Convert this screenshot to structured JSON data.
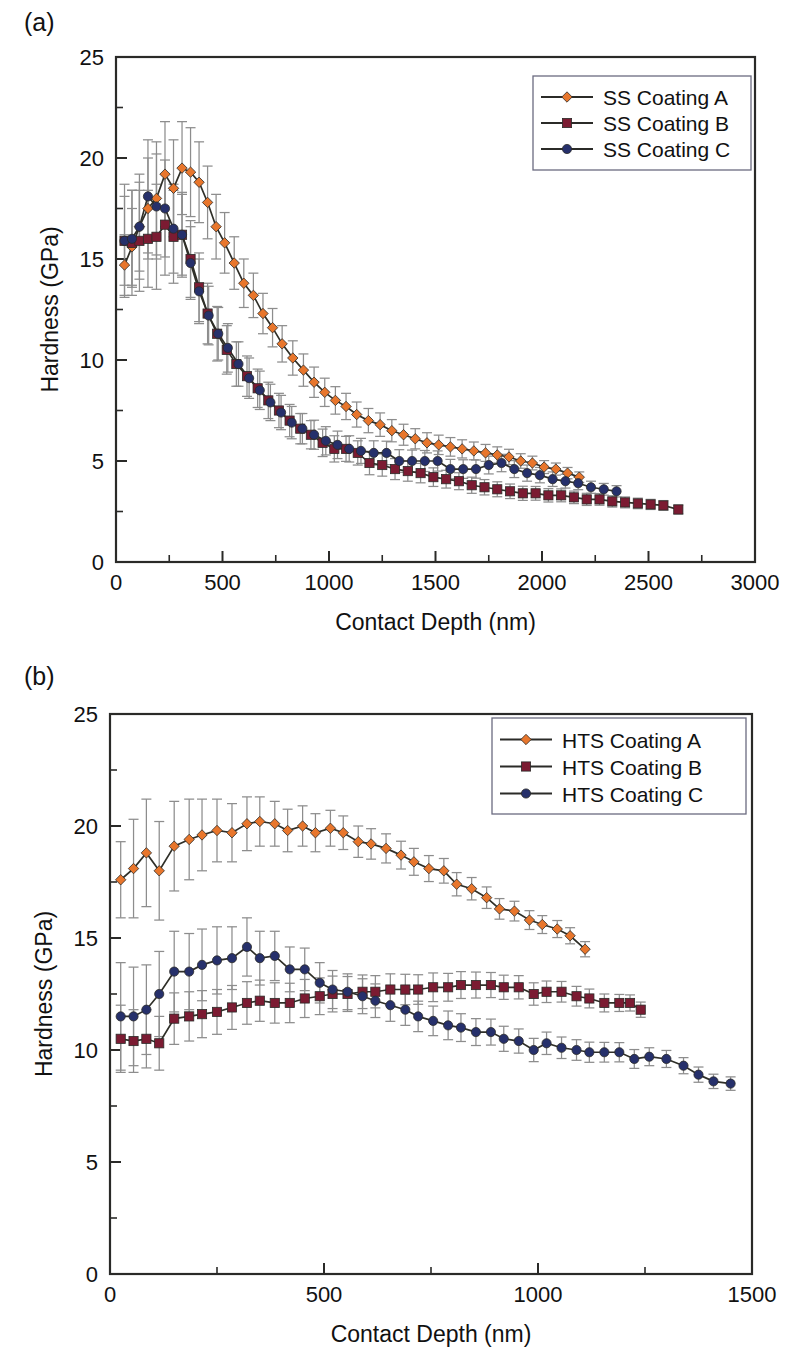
{
  "figure": {
    "panels": [
      {
        "id": "a",
        "label": "(a)",
        "xlabel": "Contact Depth (nm)",
        "ylabel": "Hardness (GPa)",
        "xticks": [
          0,
          500,
          1000,
          1500,
          2000,
          2500,
          3000
        ],
        "yticks": [
          0,
          5,
          10,
          15,
          20,
          25
        ],
        "xlim": [
          0,
          3000
        ],
        "ylim": [
          0,
          25
        ]
      },
      {
        "id": "b",
        "label": "(b)",
        "xlabel": "Contact Depth (nm)",
        "ylabel": "Hardness (GPa)",
        "xticks": [
          0,
          500,
          1000,
          1500
        ],
        "yticks": [
          0,
          5,
          10,
          15,
          20,
          25
        ],
        "xlim": [
          0,
          1500
        ],
        "ylim": [
          0,
          25
        ]
      }
    ]
  },
  "colors": {
    "series_a": "#E8762C",
    "series_b": "#7B1B32",
    "series_c": "#26306B",
    "line": "#2F2F28",
    "errorbar": "#8D8D8D",
    "frame": "#2A2A28",
    "legend_border": "#6B6B80",
    "background": "#FFFFFF"
  },
  "chart_data": [
    {
      "type": "line",
      "panel": "a",
      "title": "",
      "xlabel": "Contact Depth (nm)",
      "ylabel": "Hardness (GPa)",
      "xlim": [
        0,
        3000
      ],
      "ylim": [
        0,
        25
      ],
      "xticks": [
        0,
        500,
        1000,
        1500,
        2000,
        2500,
        3000
      ],
      "yticks": [
        0,
        5,
        10,
        15,
        20,
        25
      ],
      "grid": false,
      "legend_position": "top-right",
      "error_bars": "symmetric-y",
      "series": [
        {
          "name": "SS Coating A",
          "color": "#E8762C",
          "marker": "diamond",
          "x": [
            40,
            75,
            110,
            150,
            190,
            230,
            270,
            310,
            350,
            390,
            430,
            470,
            510,
            555,
            600,
            645,
            690,
            735,
            780,
            830,
            880,
            930,
            980,
            1030,
            1080,
            1130,
            1185,
            1240,
            1295,
            1350,
            1405,
            1460,
            1515,
            1570,
            1625,
            1680,
            1735,
            1790,
            1845,
            1900,
            1955,
            2010,
            2065,
            2120,
            2175
          ],
          "y": [
            14.7,
            15.6,
            16.6,
            17.5,
            18.0,
            19.2,
            18.5,
            19.5,
            19.3,
            18.8,
            17.8,
            16.6,
            15.8,
            14.8,
            13.8,
            13.2,
            12.3,
            11.6,
            10.8,
            10.1,
            9.5,
            8.9,
            8.4,
            8.0,
            7.7,
            7.3,
            7.0,
            6.8,
            6.5,
            6.3,
            6.1,
            5.9,
            5.8,
            5.7,
            5.6,
            5.5,
            5.4,
            5.3,
            5.2,
            5.0,
            4.9,
            4.7,
            4.6,
            4.4,
            4.2
          ],
          "yerr": [
            1.5,
            1.9,
            2.2,
            2.5,
            2.8,
            2.6,
            2.4,
            2.3,
            2.2,
            2.0,
            1.8,
            1.6,
            1.5,
            1.3,
            1.2,
            1.1,
            1.0,
            0.95,
            0.9,
            0.85,
            0.8,
            0.75,
            0.7,
            0.68,
            0.65,
            0.62,
            0.6,
            0.58,
            0.55,
            0.52,
            0.5,
            0.5,
            0.48,
            0.46,
            0.45,
            0.44,
            0.42,
            0.4,
            0.38,
            0.36,
            0.34,
            0.32,
            0.3,
            0.28,
            0.26
          ]
        },
        {
          "name": "SS Coating B",
          "color": "#7B1B32",
          "marker": "square",
          "x": [
            40,
            75,
            110,
            150,
            190,
            230,
            270,
            310,
            350,
            390,
            430,
            475,
            520,
            565,
            615,
            665,
            715,
            765,
            815,
            865,
            915,
            970,
            1025,
            1080,
            1135,
            1190,
            1250,
            1310,
            1370,
            1430,
            1490,
            1550,
            1610,
            1670,
            1730,
            1790,
            1850,
            1910,
            1970,
            2030,
            2090,
            2150,
            2210,
            2270,
            2330,
            2390,
            2450,
            2510,
            2570,
            2640
          ],
          "y": [
            15.9,
            15.8,
            15.9,
            16.0,
            16.1,
            16.7,
            16.1,
            16.2,
            15.0,
            13.6,
            12.3,
            11.3,
            10.5,
            9.8,
            9.2,
            8.6,
            8.0,
            7.5,
            7.0,
            6.6,
            6.3,
            5.9,
            5.6,
            5.6,
            5.4,
            4.9,
            4.8,
            4.6,
            4.5,
            4.4,
            4.2,
            4.1,
            4.0,
            3.8,
            3.7,
            3.6,
            3.5,
            3.4,
            3.4,
            3.3,
            3.3,
            3.2,
            3.1,
            3.1,
            3.0,
            2.95,
            2.9,
            2.85,
            2.8,
            2.6
          ],
          "yerr": [
            2.8,
            2.6,
            2.5,
            2.4,
            2.6,
            2.5,
            2.3,
            2.1,
            1.9,
            1.7,
            1.5,
            1.35,
            1.2,
            1.1,
            1.0,
            0.95,
            0.9,
            0.85,
            0.8,
            0.75,
            0.7,
            0.68,
            0.65,
            0.62,
            0.6,
            0.58,
            0.55,
            0.52,
            0.5,
            0.48,
            0.46,
            0.44,
            0.42,
            0.4,
            0.38,
            0.37,
            0.36,
            0.35,
            0.34,
            0.33,
            0.32,
            0.31,
            0.3,
            0.29,
            0.28,
            0.27,
            0.26,
            0.25,
            0.24,
            0.22
          ]
        },
        {
          "name": "SS Coating C",
          "color": "#26306B",
          "marker": "circle",
          "x": [
            40,
            75,
            110,
            150,
            190,
            230,
            270,
            310,
            350,
            390,
            435,
            480,
            525,
            575,
            625,
            675,
            725,
            775,
            825,
            875,
            930,
            985,
            1040,
            1095,
            1150,
            1210,
            1270,
            1330,
            1390,
            1450,
            1510,
            1570,
            1630,
            1690,
            1750,
            1810,
            1870,
            1930,
            1990,
            2050,
            2110,
            2170,
            2230,
            2290,
            2350
          ],
          "y": [
            15.9,
            16.0,
            16.6,
            18.1,
            17.6,
            17.5,
            16.5,
            16.2,
            14.8,
            13.4,
            12.2,
            11.3,
            10.6,
            9.8,
            9.1,
            8.5,
            7.9,
            7.4,
            6.9,
            6.6,
            6.3,
            6.0,
            5.8,
            5.6,
            5.5,
            5.4,
            5.4,
            5.0,
            5.0,
            5.0,
            5.0,
            4.6,
            4.6,
            4.6,
            4.8,
            4.9,
            4.6,
            4.4,
            4.3,
            4.1,
            4.0,
            3.9,
            3.7,
            3.6,
            3.5
          ],
          "yerr": [
            2.2,
            2.4,
            2.6,
            2.8,
            2.6,
            2.4,
            2.2,
            2.0,
            1.8,
            1.6,
            1.45,
            1.3,
            1.2,
            1.1,
            1.0,
            0.95,
            0.9,
            0.85,
            0.8,
            0.75,
            0.72,
            0.7,
            0.68,
            0.65,
            0.62,
            0.6,
            0.58,
            0.56,
            0.54,
            0.52,
            0.5,
            0.48,
            0.46,
            0.45,
            0.44,
            0.43,
            0.42,
            0.4,
            0.38,
            0.36,
            0.34,
            0.32,
            0.3,
            0.29,
            0.28
          ]
        }
      ]
    },
    {
      "type": "line",
      "panel": "b",
      "title": "",
      "xlabel": "Contact Depth (nm)",
      "ylabel": "Hardness (GPa)",
      "xlim": [
        0,
        1500
      ],
      "ylim": [
        0,
        25
      ],
      "xticks": [
        0,
        500,
        1000,
        1500
      ],
      "yticks": [
        0,
        5,
        10,
        15,
        20,
        25
      ],
      "grid": false,
      "legend_position": "top-right",
      "error_bars": "symmetric-y",
      "series": [
        {
          "name": "HTS Coating A",
          "color": "#E8762C",
          "marker": "diamond",
          "x": [
            25,
            55,
            85,
            115,
            150,
            185,
            215,
            250,
            285,
            320,
            350,
            385,
            415,
            450,
            480,
            515,
            545,
            580,
            610,
            645,
            680,
            710,
            745,
            780,
            810,
            845,
            880,
            910,
            945,
            980,
            1010,
            1045,
            1075,
            1110
          ],
          "y": [
            17.6,
            18.1,
            18.8,
            18.0,
            19.1,
            19.4,
            19.6,
            19.8,
            19.7,
            20.1,
            20.2,
            20.1,
            19.8,
            20.0,
            19.7,
            19.9,
            19.7,
            19.3,
            19.2,
            19.0,
            18.7,
            18.4,
            18.1,
            18.0,
            17.4,
            17.2,
            16.8,
            16.3,
            16.2,
            15.8,
            15.6,
            15.4,
            15.1,
            14.5
          ],
          "yerr": [
            1.7,
            2.2,
            2.4,
            2.2,
            2.0,
            1.8,
            1.6,
            1.4,
            1.3,
            1.2,
            1.1,
            1.0,
            0.95,
            0.9,
            0.85,
            0.8,
            0.75,
            0.7,
            0.68,
            0.65,
            0.62,
            0.6,
            0.58,
            0.55,
            0.52,
            0.5,
            0.48,
            0.46,
            0.44,
            0.42,
            0.4,
            0.38,
            0.36,
            0.34
          ]
        },
        {
          "name": "HTS Coating B",
          "color": "#7B1B32",
          "marker": "square",
          "x": [
            25,
            55,
            85,
            115,
            150,
            185,
            215,
            250,
            285,
            320,
            350,
            385,
            420,
            455,
            490,
            520,
            555,
            590,
            620,
            655,
            690,
            720,
            755,
            790,
            820,
            855,
            890,
            920,
            955,
            990,
            1020,
            1055,
            1090,
            1120,
            1155,
            1190,
            1215,
            1240
          ],
          "y": [
            10.5,
            10.4,
            10.5,
            10.3,
            11.4,
            11.5,
            11.6,
            11.7,
            11.9,
            12.1,
            12.2,
            12.1,
            12.1,
            12.3,
            12.4,
            12.5,
            12.5,
            12.6,
            12.6,
            12.7,
            12.7,
            12.7,
            12.8,
            12.8,
            12.9,
            12.9,
            12.9,
            12.8,
            12.8,
            12.5,
            12.6,
            12.6,
            12.4,
            12.3,
            12.1,
            12.1,
            12.1,
            11.8
          ],
          "yerr": [
            1.5,
            1.4,
            1.3,
            1.2,
            1.15,
            1.1,
            1.05,
            1.0,
            0.98,
            0.95,
            0.92,
            0.9,
            0.88,
            0.85,
            0.82,
            0.8,
            0.78,
            0.75,
            0.72,
            0.7,
            0.68,
            0.66,
            0.64,
            0.62,
            0.6,
            0.58,
            0.56,
            0.54,
            0.52,
            0.5,
            0.48,
            0.46,
            0.44,
            0.42,
            0.4,
            0.38,
            0.36,
            0.34
          ]
        },
        {
          "name": "HTS Coating C",
          "color": "#26306B",
          "marker": "circle",
          "x": [
            25,
            55,
            85,
            115,
            150,
            185,
            215,
            250,
            285,
            320,
            350,
            385,
            420,
            455,
            490,
            520,
            555,
            590,
            620,
            655,
            690,
            720,
            755,
            790,
            820,
            855,
            890,
            920,
            955,
            990,
            1020,
            1055,
            1090,
            1120,
            1155,
            1190,
            1225,
            1260,
            1300,
            1340,
            1375,
            1410,
            1450
          ],
          "y": [
            11.5,
            11.5,
            11.8,
            12.5,
            13.5,
            13.5,
            13.8,
            14.0,
            14.1,
            14.6,
            14.1,
            14.2,
            13.6,
            13.6,
            13.0,
            12.7,
            12.6,
            12.4,
            12.2,
            12.0,
            11.8,
            11.5,
            11.3,
            11.1,
            11.0,
            10.8,
            10.8,
            10.5,
            10.4,
            10.0,
            10.3,
            10.1,
            10.0,
            9.9,
            9.9,
            9.9,
            9.6,
            9.7,
            9.6,
            9.3,
            8.9,
            8.6,
            8.5
          ],
          "yerr": [
            2.4,
            2.2,
            2.0,
            1.9,
            1.8,
            1.7,
            1.6,
            1.5,
            1.4,
            1.3,
            1.2,
            1.1,
            1.0,
            0.95,
            0.9,
            0.85,
            0.8,
            0.78,
            0.75,
            0.72,
            0.7,
            0.68,
            0.66,
            0.64,
            0.62,
            0.6,
            0.58,
            0.56,
            0.54,
            0.52,
            0.5,
            0.48,
            0.46,
            0.45,
            0.44,
            0.43,
            0.42,
            0.4,
            0.38,
            0.36,
            0.34,
            0.32,
            0.3
          ]
        }
      ]
    }
  ]
}
